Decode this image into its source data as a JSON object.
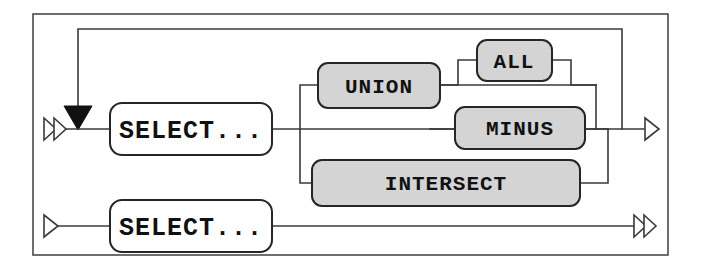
{
  "diagram": {
    "kind": "railroad-syntax-diagram",
    "canvas": {
      "width": 701,
      "height": 268
    },
    "colors": {
      "background": "#ffffff",
      "wire": "#3a3a3a",
      "frame": "#4a4a4a",
      "keyword_fill": "#d4d4d4",
      "placeholder_fill": "#ffffff",
      "box_stroke": "#262626",
      "text": "#111111"
    },
    "nodes": {
      "select_top": {
        "label": "SELECT...",
        "style": "hollow",
        "x": 110,
        "y": 103,
        "w": 162,
        "h": 52,
        "r": 12,
        "font": "label-lg"
      },
      "union": {
        "label": "UNION",
        "style": "filled",
        "x": 318,
        "y": 63,
        "w": 122,
        "h": 45,
        "r": 10,
        "font": "label-md"
      },
      "all": {
        "label": "ALL",
        "style": "filled",
        "x": 477,
        "y": 40,
        "w": 75,
        "h": 41,
        "r": 10,
        "font": "label-md"
      },
      "minus": {
        "label": "MINUS",
        "style": "filled",
        "x": 455,
        "y": 107,
        "w": 130,
        "h": 42,
        "r": 10,
        "font": "label-md"
      },
      "intersect": {
        "label": "INTERSECT",
        "style": "filled",
        "x": 312,
        "y": 160,
        "w": 268,
        "h": 46,
        "r": 10,
        "font": "label-md"
      },
      "select_bottom": {
        "label": "SELECT...",
        "style": "hollow",
        "x": 110,
        "y": 200,
        "w": 162,
        "h": 52,
        "r": 12,
        "font": "label-lg"
      }
    },
    "terminals": [
      {
        "name": "entry-top",
        "glyph": "double-chevron",
        "direction": "right",
        "x": 44,
        "y": 129
      },
      {
        "name": "exit-top",
        "glyph": "single-chevron",
        "direction": "right",
        "x": 648,
        "y": 129
      },
      {
        "name": "entry-bottom",
        "glyph": "single-chevron",
        "direction": "right",
        "x": 44,
        "y": 226
      },
      {
        "name": "exit-bottom",
        "glyph": "double-chevron",
        "direction": "right",
        "x": 641,
        "y": 226
      }
    ],
    "markers": [
      {
        "name": "loopback-join-arrow",
        "glyph": "solid-down-triangle",
        "x": 78,
        "y": 129
      }
    ],
    "rails": {
      "main_line_y": 129,
      "bottom_line_y": 226,
      "loopback_top_y": 29,
      "loopback_left_x": 78,
      "loopback_right_x": 622,
      "branch_in_x": 300,
      "branch_out_x": 596,
      "union_row_y": 85,
      "all_row_y": 60,
      "intersect_row_y": 183
    },
    "frame": {
      "x": 33,
      "y": 14,
      "w": 635,
      "h": 241
    },
    "paths": [
      "SELECT... then optionally loop back through UNION / UNION ALL / MINUS / INTERSECT",
      "SELECT... straight through to exit"
    ]
  }
}
